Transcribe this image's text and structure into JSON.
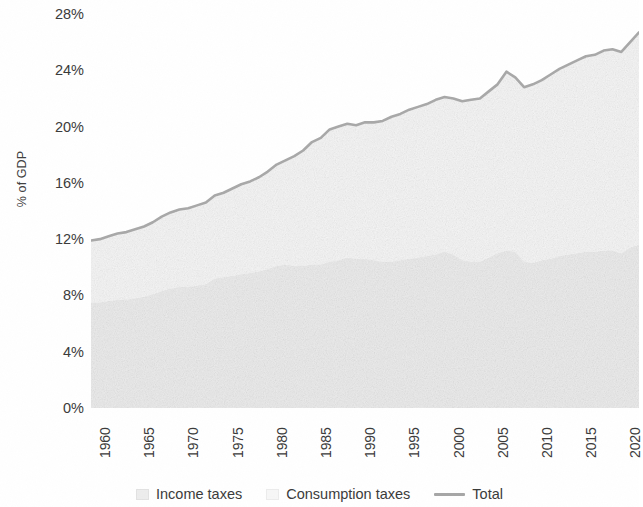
{
  "chart_data": {
    "type": "area",
    "title": "",
    "subtitle": "",
    "xlabel": "",
    "ylabel": "% of GDP",
    "xlim": [
      1960,
      2022
    ],
    "ylim": [
      0,
      28
    ],
    "y_ticks": [
      "0%",
      "4%",
      "8%",
      "12%",
      "16%",
      "20%",
      "24%",
      "28%"
    ],
    "y_tick_values": [
      0,
      4,
      8,
      12,
      16,
      20,
      24,
      28
    ],
    "x_ticks": [
      "1960",
      "1965",
      "1970",
      "1975",
      "1980",
      "1985",
      "1990",
      "1995",
      "2000",
      "2005",
      "2010",
      "2015",
      "2020"
    ],
    "x_tick_values": [
      1960,
      1965,
      1970,
      1975,
      1980,
      1985,
      1990,
      1995,
      2000,
      2005,
      2010,
      2015,
      2020
    ],
    "grid": false,
    "legend_position": "bottom",
    "stacked": true,
    "x": [
      1960,
      1961,
      1962,
      1963,
      1964,
      1965,
      1966,
      1967,
      1968,
      1969,
      1970,
      1971,
      1972,
      1973,
      1974,
      1975,
      1976,
      1977,
      1978,
      1979,
      1980,
      1981,
      1982,
      1983,
      1984,
      1985,
      1986,
      1987,
      1988,
      1989,
      1990,
      1991,
      1992,
      1993,
      1994,
      1995,
      1996,
      1997,
      1998,
      1999,
      2000,
      2001,
      2002,
      2003,
      2004,
      2005,
      2006,
      2007,
      2008,
      2009,
      2010,
      2011,
      2012,
      2013,
      2014,
      2015,
      2016,
      2017,
      2018,
      2019,
      2020,
      2021,
      2022
    ],
    "series": [
      {
        "name": "Income taxes",
        "color": "#ededed",
        "values": [
          7.5,
          7.5,
          7.6,
          7.7,
          7.7,
          7.8,
          7.9,
          8.1,
          8.3,
          8.5,
          8.6,
          8.6,
          8.7,
          8.8,
          9.2,
          9.3,
          9.4,
          9.5,
          9.6,
          9.7,
          9.9,
          10.1,
          10.2,
          10.1,
          10.1,
          10.2,
          10.2,
          10.4,
          10.5,
          10.7,
          10.6,
          10.6,
          10.5,
          10.4,
          10.4,
          10.5,
          10.6,
          10.7,
          10.8,
          10.9,
          11.1,
          10.9,
          10.5,
          10.4,
          10.4,
          10.7,
          11.0,
          11.2,
          11.1,
          10.4,
          10.3,
          10.5,
          10.6,
          10.8,
          10.9,
          11.0,
          11.1,
          11.1,
          11.2,
          11.2,
          11.0,
          11.4,
          11.6
        ]
      },
      {
        "name": "Consumption taxes",
        "color": "#f7f7f7",
        "values": [
          4.4,
          4.5,
          4.6,
          4.7,
          4.8,
          4.9,
          5.0,
          5.1,
          5.3,
          5.4,
          5.5,
          5.6,
          5.7,
          5.8,
          5.9,
          6.0,
          6.2,
          6.4,
          6.5,
          6.7,
          6.9,
          7.2,
          7.4,
          7.8,
          8.2,
          8.7,
          9.0,
          9.4,
          9.5,
          9.5,
          9.5,
          9.7,
          9.8,
          10.0,
          10.3,
          10.4,
          10.6,
          10.7,
          10.8,
          11.0,
          11.0,
          11.1,
          11.3,
          11.5,
          11.6,
          11.8,
          12.0,
          12.7,
          12.4,
          12.4,
          12.7,
          12.8,
          13.1,
          13.3,
          13.5,
          13.7,
          13.9,
          14.0,
          14.2,
          14.3,
          14.3,
          14.6,
          15.1
        ]
      }
    ],
    "total_series": {
      "name": "Total",
      "color": "#a6a6a6",
      "values": [
        11.9,
        12.0,
        12.2,
        12.4,
        12.5,
        12.7,
        12.9,
        13.2,
        13.6,
        13.9,
        14.1,
        14.2,
        14.4,
        14.6,
        15.1,
        15.3,
        15.6,
        15.9,
        16.1,
        16.4,
        16.8,
        17.3,
        17.6,
        17.9,
        18.3,
        18.9,
        19.2,
        19.8,
        20.0,
        20.2,
        20.1,
        20.3,
        20.3,
        20.4,
        20.7,
        20.9,
        21.2,
        21.4,
        21.6,
        21.9,
        22.1,
        22.0,
        21.8,
        21.9,
        22.0,
        22.5,
        23.0,
        23.9,
        23.5,
        22.8,
        23.0,
        23.3,
        23.7,
        24.1,
        24.4,
        24.7,
        25.0,
        25.1,
        25.4,
        25.5,
        25.3,
        26.0,
        26.7
      ]
    }
  },
  "axes": {
    "y_title": "% of GDP"
  },
  "legend": {
    "items": [
      {
        "label": "Income taxes",
        "type": "area",
        "color": "#ededed"
      },
      {
        "label": "Consumption taxes",
        "type": "area",
        "color": "#f7f7f7"
      },
      {
        "label": "Total",
        "type": "line",
        "color": "#a6a6a6"
      }
    ]
  }
}
